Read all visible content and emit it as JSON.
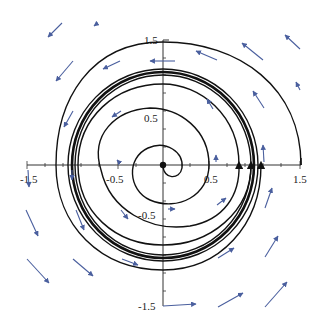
{
  "diagram": {
    "type": "phase-portrait",
    "axes": {
      "x_ticks": [
        "-1.5",
        "-0.5",
        "0.5",
        "1.5"
      ],
      "y_ticks": [
        "1.5",
        "0.5",
        "-0.5",
        "-1.5"
      ],
      "range": [
        -1.5,
        1.5
      ]
    },
    "colors": {
      "trajectory": "#111111",
      "vector_field": "#4a5f9e",
      "axis": "#333333"
    },
    "fixed_point": "origin",
    "limit_cycle": "unit circle (thick), trajectories spiral toward it from inside and outside",
    "trajectory_start_points_on_x_axis": [
      0.5,
      0.85,
      0.98,
      1.02,
      1.08,
      1.5
    ]
  }
}
